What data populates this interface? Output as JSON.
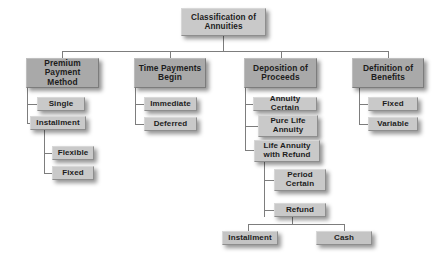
{
  "diagram": {
    "title": "Classification of Annuities",
    "root": {
      "label": "Classification of Annuities"
    },
    "branches": [
      {
        "label": "Premium Payment Method",
        "children": [
          {
            "label": "Single"
          },
          {
            "label": "Installment"
          },
          {
            "label": "Flexible"
          },
          {
            "label": "Fixed"
          }
        ]
      },
      {
        "label": "Time Payments Begin",
        "children": [
          {
            "label": "Immediate"
          },
          {
            "label": "Deferred"
          }
        ]
      },
      {
        "label": "Deposition of Proceeds",
        "children": [
          {
            "label": "Annuity Certain"
          },
          {
            "label": "Pure Life Annuity"
          },
          {
            "label": "Life Annuity with Refund"
          },
          {
            "label": "Period Certain"
          },
          {
            "label": "Refund"
          },
          {
            "label": "Installment"
          },
          {
            "label": "Cash"
          }
        ]
      },
      {
        "label": "Definition of Benefits",
        "children": [
          {
            "label": "Fixed"
          },
          {
            "label": "Variable"
          }
        ]
      }
    ]
  },
  "colors": {
    "background": "#ffffff",
    "node_light": "#c9c9c9",
    "node_dark": "#a9a9a9",
    "connector": "#7d7d7d",
    "text": "#1c1c1c"
  }
}
